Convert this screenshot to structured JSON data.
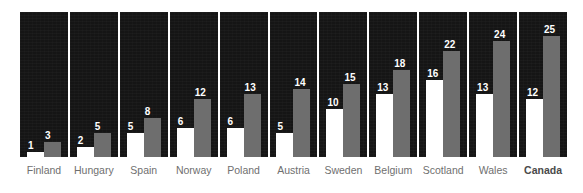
{
  "chart_data": {
    "type": "bar",
    "title": "",
    "subtitle": "",
    "xlabel": "",
    "ylabel": "",
    "ylim": [
      0,
      25
    ],
    "grid": false,
    "legend_position": "none",
    "categories": [
      "Finland",
      "Hungary",
      "Spain",
      "Norway",
      "Poland",
      "Austria",
      "Sweden",
      "Belgium",
      "Scotland",
      "Wales",
      "Canada"
    ],
    "emphasized_categories": [
      "Canada"
    ],
    "series": [
      {
        "name": "series-1",
        "color": "#ffffff",
        "values": [
          1,
          2,
          5,
          6,
          6,
          5,
          10,
          13,
          16,
          13,
          12
        ]
      },
      {
        "name": "series-2",
        "color": "#6e6e6e",
        "values": [
          3,
          5,
          8,
          12,
          13,
          14,
          15,
          18,
          22,
          24,
          25
        ]
      }
    ],
    "annotations": []
  },
  "style": {
    "panel_background": "#151515",
    "page_background": "#ffffff",
    "value_label_color": "#ffffff",
    "category_label_color": "#6f6f6f",
    "category_emphasis_color": "#4a4a4a",
    "separator_color": "#ffffff"
  }
}
